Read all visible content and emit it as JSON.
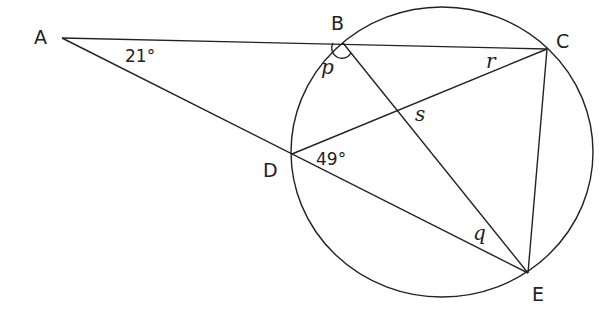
{
  "diagram": {
    "type": "circle-geometry",
    "points": {
      "A": {
        "label": "A",
        "x": 62,
        "y": 38
      },
      "B": {
        "label": "B",
        "x": 343,
        "y": 43
      },
      "C": {
        "label": "C",
        "x": 547,
        "y": 49
      },
      "D": {
        "label": "D",
        "x": 292,
        "y": 154
      },
      "E": {
        "label": "E",
        "x": 528,
        "y": 273
      }
    },
    "circle": {
      "cx": 442,
      "cy": 152,
      "rx": 151,
      "ry": 145
    },
    "segments": [
      "AC",
      "AE",
      "BE",
      "DC",
      "CE"
    ],
    "angles": {
      "A": {
        "label": "21°"
      },
      "D": {
        "label": "49°"
      },
      "p": {
        "label": "p",
        "at": "B"
      },
      "q": {
        "label": "q",
        "at": "E"
      },
      "r": {
        "label": "r",
        "at": "C"
      },
      "s": {
        "label": "s",
        "at": "intersection of BE and DC"
      }
    },
    "colors": {
      "stroke": "#222222",
      "background": "#ffffff"
    }
  }
}
